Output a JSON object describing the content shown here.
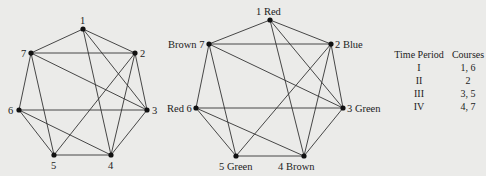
{
  "left_graph": {
    "vertices": [
      {
        "id": "1",
        "label": "1",
        "x": 83,
        "y": 29,
        "lx": 80,
        "ly": 24
      },
      {
        "id": "2",
        "label": "2",
        "x": 135,
        "y": 53,
        "lx": 140,
        "ly": 57
      },
      {
        "id": "3",
        "label": "3",
        "x": 147,
        "y": 110,
        "lx": 152,
        "ly": 114
      },
      {
        "id": "4",
        "label": "4",
        "x": 111,
        "y": 155,
        "lx": 108,
        "ly": 169
      },
      {
        "id": "5",
        "label": "5",
        "x": 54,
        "y": 155,
        "lx": 51,
        "ly": 169
      },
      {
        "id": "6",
        "label": "6",
        "x": 19,
        "y": 110,
        "lx": 8,
        "ly": 114
      },
      {
        "id": "7",
        "label": "7",
        "x": 31,
        "y": 53,
        "lx": 21,
        "ly": 57
      }
    ],
    "edges": [
      [
        "1",
        "7"
      ],
      [
        "1",
        "2"
      ],
      [
        "1",
        "3"
      ],
      [
        "1",
        "4"
      ],
      [
        "7",
        "2"
      ],
      [
        "7",
        "3"
      ],
      [
        "7",
        "6"
      ],
      [
        "7",
        "5"
      ],
      [
        "2",
        "3"
      ],
      [
        "2",
        "5"
      ],
      [
        "2",
        "4"
      ],
      [
        "6",
        "3"
      ],
      [
        "6",
        "5"
      ],
      [
        "6",
        "4"
      ],
      [
        "5",
        "4"
      ],
      [
        "4",
        "3"
      ]
    ]
  },
  "right_graph": {
    "vertices": [
      {
        "id": "1",
        "label": "1 Red",
        "x": 270,
        "y": 20,
        "lx": 256,
        "ly": 15
      },
      {
        "id": "2",
        "label": "2 Blue",
        "x": 331,
        "y": 44,
        "lx": 335,
        "ly": 48
      },
      {
        "id": "3",
        "label": "3 Green",
        "x": 343,
        "y": 108,
        "lx": 347,
        "ly": 112
      },
      {
        "id": "4",
        "label": "4 Brown",
        "x": 304,
        "y": 156,
        "lx": 278,
        "ly": 170
      },
      {
        "id": "5",
        "label": "5 Green",
        "x": 236,
        "y": 156,
        "lx": 219,
        "ly": 170
      },
      {
        "id": "6",
        "label": "Red 6",
        "x": 196,
        "y": 108,
        "lx": 167,
        "ly": 112
      },
      {
        "id": "7",
        "label": "Brown 7",
        "x": 209,
        "y": 44,
        "lx": 168,
        "ly": 48
      }
    ],
    "edges": [
      [
        "1",
        "7"
      ],
      [
        "1",
        "2"
      ],
      [
        "1",
        "3"
      ],
      [
        "1",
        "4"
      ],
      [
        "7",
        "2"
      ],
      [
        "7",
        "3"
      ],
      [
        "7",
        "6"
      ],
      [
        "7",
        "5"
      ],
      [
        "2",
        "3"
      ],
      [
        "2",
        "5"
      ],
      [
        "2",
        "4"
      ],
      [
        "6",
        "3"
      ],
      [
        "6",
        "5"
      ],
      [
        "6",
        "4"
      ],
      [
        "5",
        "4"
      ],
      [
        "4",
        "3"
      ]
    ]
  },
  "table": {
    "headers": [
      "Time Period",
      "Courses"
    ],
    "rows": [
      [
        "I",
        "1, 6"
      ],
      [
        "II",
        "2"
      ],
      [
        "III",
        "3, 5"
      ],
      [
        "IV",
        "4, 7"
      ]
    ]
  }
}
